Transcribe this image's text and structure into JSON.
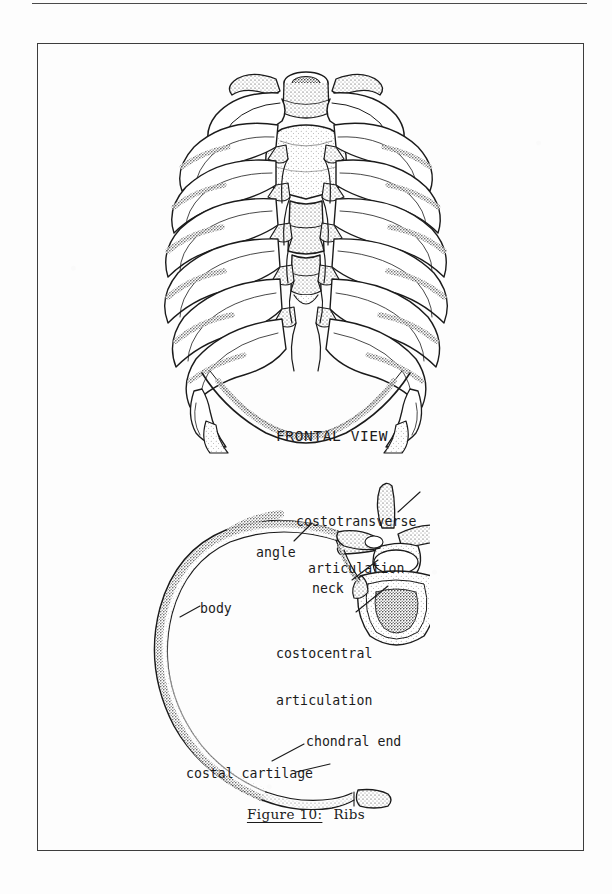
{
  "page": {
    "background_color": "#fdfdfd",
    "ink_color": "#1b1b1b",
    "frame_color": "#3d3d3d"
  },
  "figure": {
    "caption_number": "Figure 10:",
    "caption_title": "Ribs"
  },
  "labels": {
    "frontal_view": "FRONTAL VIEW",
    "costotransverse_line1": "costotransverse",
    "costotransverse_line2": "articulation",
    "angle": "angle",
    "neck": "neck",
    "body": "body",
    "costocentral_line1": "costocentral",
    "costocentral_line2": "articulation",
    "chondral_end": "chondral end",
    "costal_cartilage": "costal cartilage"
  },
  "illustrations": {
    "ribcage": "thoracic-ribcage-frontal-view",
    "rib_detail": "single-rib-with-thoracic-vertebra"
  }
}
